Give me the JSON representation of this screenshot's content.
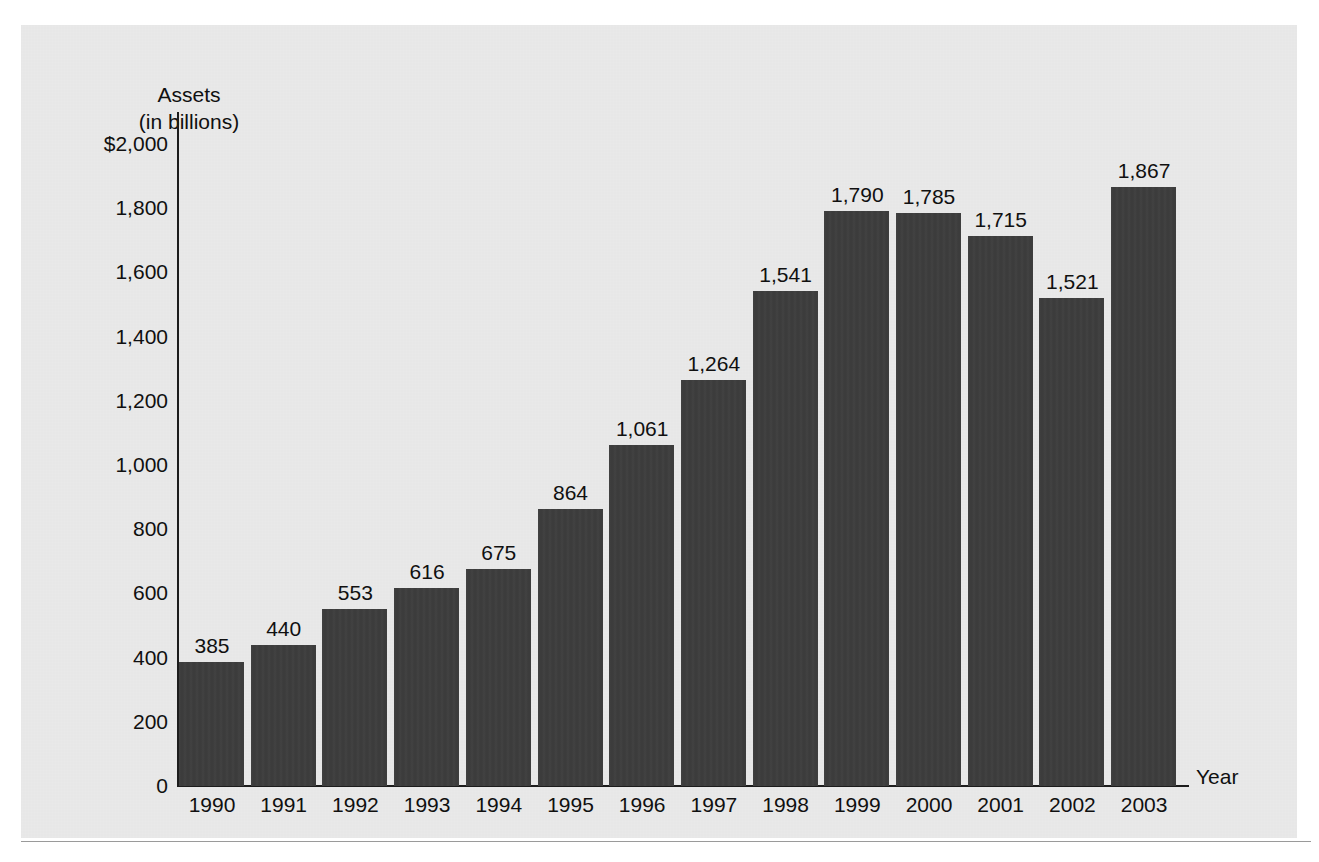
{
  "figure": {
    "background_color": "#ffffff",
    "panel_color": "#e9e9e9",
    "bar_color": "#3c3c3c",
    "axis_color": "#1c1c1c",
    "text_color": "#101010"
  },
  "axis": {
    "y_title_line1": "Assets",
    "y_title_line2": "(in billions)",
    "x_title": "Year"
  },
  "chart_data": {
    "type": "bar",
    "title": "",
    "subtitle": "",
    "xlabel": "Year",
    "ylabel": "Assets (in billions)",
    "categories": [
      "1990",
      "1991",
      "1992",
      "1993",
      "1994",
      "1995",
      "1996",
      "1997",
      "1998",
      "1999",
      "2000",
      "2001",
      "2002",
      "2003"
    ],
    "values": [
      385,
      440,
      553,
      616,
      675,
      864,
      1061,
      1264,
      1541,
      1790,
      1785,
      1715,
      1521,
      1867
    ],
    "value_labels": [
      "385",
      "440",
      "553",
      "616",
      "675",
      "864",
      "1,061",
      "1,264",
      "1,541",
      "1,790",
      "1,785",
      "1,715",
      "1,521",
      "1,867"
    ],
    "ylim": [
      0,
      2000
    ],
    "ytick_values": [
      2000,
      1800,
      1600,
      1400,
      1200,
      1000,
      800,
      600,
      400,
      200,
      0
    ],
    "ytick_labels": [
      "$2,000",
      "1,800",
      "1,600",
      "1,400",
      "1,200",
      "1,000",
      "800",
      "600",
      "400",
      "200",
      "0"
    ],
    "grid": false,
    "legend": false,
    "legend_position": "none",
    "data_labels": true,
    "series": [
      {
        "name": "Assets",
        "values": [
          385,
          440,
          553,
          616,
          675,
          864,
          1061,
          1264,
          1541,
          1790,
          1785,
          1715,
          1521,
          1867
        ]
      }
    ]
  }
}
